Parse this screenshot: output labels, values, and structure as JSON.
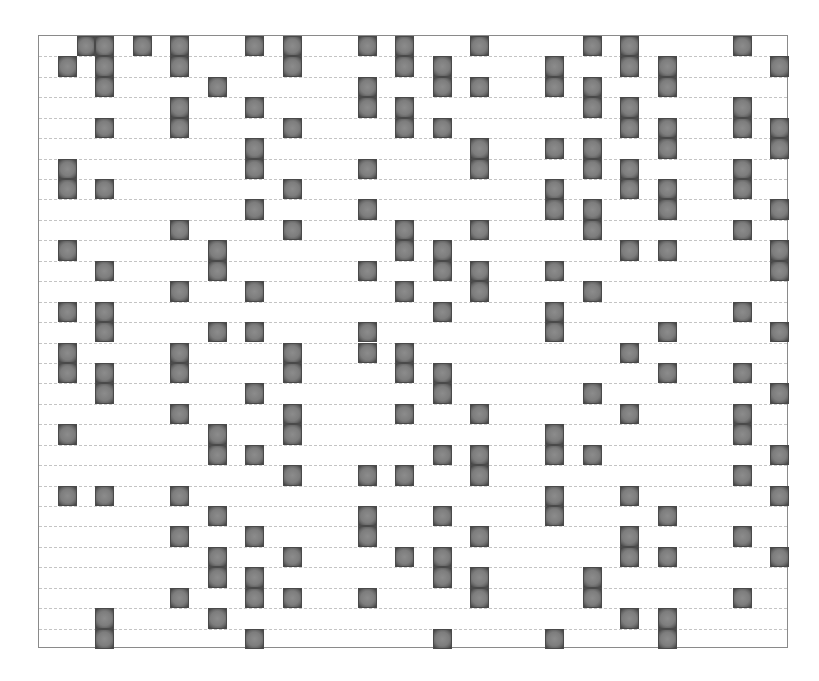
{
  "grid": {
    "rows": 30,
    "cols": 40,
    "cell_color": "#7f7f7f",
    "cell_edge_color": "#3e3e3e",
    "line_color": "#c4c4c4",
    "frame_color": "#8a8a8a",
    "filled": [
      [
        2,
        3,
        5,
        7,
        11,
        13,
        17,
        19,
        23,
        29,
        31,
        37
      ],
      [
        1,
        3,
        7,
        13,
        19,
        21,
        27,
        31,
        33,
        39
      ],
      [
        3,
        9,
        17,
        21,
        23,
        27,
        29,
        33
      ],
      [
        7,
        11,
        17,
        19,
        29,
        31,
        37
      ],
      [
        3,
        7,
        13,
        19,
        21,
        31,
        33,
        37,
        39
      ],
      [
        11,
        23,
        27,
        29,
        33,
        39
      ],
      [
        1,
        11,
        17,
        23,
        29,
        31,
        37
      ],
      [
        1,
        3,
        13,
        27,
        31,
        33,
        37
      ],
      [
        11,
        17,
        27,
        29,
        33,
        39
      ],
      [
        7,
        13,
        19,
        23,
        29,
        37
      ],
      [
        1,
        9,
        19,
        21,
        31,
        33,
        39
      ],
      [
        3,
        9,
        17,
        21,
        23,
        27,
        39
      ],
      [
        7,
        11,
        19,
        23,
        29
      ],
      [
        1,
        3,
        21,
        27,
        37
      ],
      [
        3,
        9,
        11,
        17,
        27,
        33,
        39
      ],
      [
        1,
        7,
        13,
        17,
        19,
        31
      ],
      [
        1,
        3,
        7,
        13,
        19,
        21,
        33,
        37
      ],
      [
        3,
        11,
        21,
        29,
        39
      ],
      [
        7,
        13,
        19,
        23,
        31,
        37
      ],
      [
        1,
        9,
        13,
        27,
        37
      ],
      [
        9,
        11,
        21,
        23,
        27,
        29,
        39
      ],
      [
        13,
        17,
        19,
        23,
        37
      ],
      [
        1,
        3,
        7,
        27,
        31,
        39
      ],
      [
        9,
        17,
        21,
        27,
        33
      ],
      [
        7,
        11,
        17,
        23,
        31,
        37
      ],
      [
        9,
        13,
        19,
        21,
        31,
        33,
        39
      ],
      [
        9,
        11,
        21,
        23,
        29
      ],
      [
        7,
        11,
        13,
        17,
        23,
        29,
        37
      ],
      [
        3,
        9,
        31,
        33
      ],
      [
        3,
        11,
        21,
        27,
        33
      ]
    ]
  }
}
